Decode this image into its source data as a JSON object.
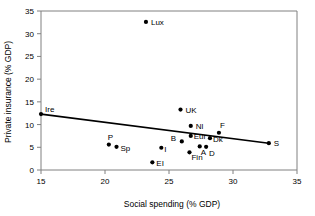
{
  "chart_data": {
    "type": "scatter",
    "title": "",
    "xlabel": "Social spending (% GDP)",
    "ylabel": "Private insurance (% GDP)",
    "xlim": [
      15,
      35
    ],
    "ylim": [
      0,
      35
    ],
    "xticks": [
      15,
      20,
      25,
      30,
      35
    ],
    "yticks": [
      0,
      5,
      10,
      15,
      20,
      25,
      30,
      35
    ],
    "grid": false,
    "legend": "none",
    "points": [
      {
        "label": "Ire",
        "x": 15.0,
        "y": 12.3,
        "lx": 4,
        "ly": -2
      },
      {
        "label": "Lux",
        "x": 23.2,
        "y": 32.6,
        "lx": 5,
        "ly": 3
      },
      {
        "label": "UK",
        "x": 25.9,
        "y": 13.3,
        "lx": 5,
        "ly": 3
      },
      {
        "label": "Nl",
        "x": 26.7,
        "y": 9.7,
        "lx": 5,
        "ly": 3
      },
      {
        "label": "F",
        "x": 28.9,
        "y": 8.2,
        "lx": 1,
        "ly": -5
      },
      {
        "label": "Eur",
        "x": 26.7,
        "y": 7.5,
        "lx": 3,
        "ly": 3
      },
      {
        "label": "Dk",
        "x": 28.2,
        "y": 7.0,
        "lx": 3,
        "ly": 4
      },
      {
        "label": "B",
        "x": 26.0,
        "y": 6.3,
        "lx": -11,
        "ly": 0
      },
      {
        "label": "S",
        "x": 32.8,
        "y": 5.9,
        "lx": 5,
        "ly": 3
      },
      {
        "label": "P",
        "x": 20.3,
        "y": 5.6,
        "lx": -1,
        "ly": -5
      },
      {
        "label": "A",
        "x": 27.4,
        "y": 5.2,
        "lx": 1,
        "ly": 9
      },
      {
        "label": "D",
        "x": 27.9,
        "y": 5.1,
        "lx": 3,
        "ly": 9
      },
      {
        "label": "Sp",
        "x": 20.9,
        "y": 5.1,
        "lx": 4,
        "ly": 4
      },
      {
        "label": "I",
        "x": 24.4,
        "y": 4.9,
        "lx": 3,
        "ly": 4
      },
      {
        "label": "Fin",
        "x": 26.6,
        "y": 3.9,
        "lx": 2,
        "ly": 8
      },
      {
        "label": "EI",
        "x": 23.7,
        "y": 1.7,
        "lx": 4,
        "ly": 4
      }
    ],
    "trendline": {
      "x1": 15.0,
      "y1": 12.3,
      "x2": 32.8,
      "y2": 5.9
    }
  },
  "colors": {
    "marker": "#000000",
    "axis": "#808080",
    "trendline": "#000000",
    "background": "#ffffff"
  }
}
